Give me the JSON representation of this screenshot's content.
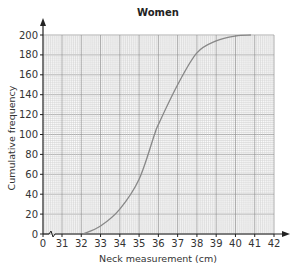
{
  "chart_data": {
    "type": "line",
    "title": "Women",
    "xlabel": "Neck measurement (cm)",
    "ylabel": "Cumulative frequency",
    "x_ticks": [
      "0",
      "31",
      "32",
      "33",
      "34",
      "35",
      "36",
      "37",
      "38",
      "39",
      "40",
      "41",
      "42"
    ],
    "y_ticks": [
      "0",
      "20",
      "40",
      "60",
      "80",
      "100",
      "120",
      "140",
      "160",
      "180",
      "200"
    ],
    "xlim": [
      31,
      42
    ],
    "ylim": [
      0,
      200
    ],
    "x_axis_break": true,
    "grid": true,
    "legend": null,
    "series": [
      {
        "name": "Women",
        "x": [
          32.1,
          33,
          34,
          35,
          35.8,
          36,
          37,
          38,
          39,
          40,
          40.8
        ],
        "values": [
          0,
          8,
          25,
          55,
          100,
          110,
          150,
          182,
          194,
          199,
          200
        ]
      }
    ]
  }
}
